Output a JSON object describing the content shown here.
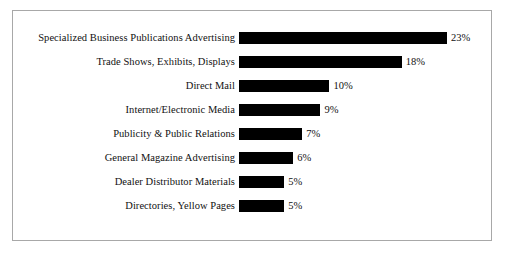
{
  "chart_data": {
    "type": "bar",
    "orientation": "horizontal",
    "title": "",
    "subtitle": "",
    "xlabel": "",
    "ylabel": "",
    "grid": false,
    "legend": false,
    "xlim": [
      0,
      23
    ],
    "value_suffix": "%",
    "categories": [
      "Specialized Business Publications Advertising",
      "Trade Shows, Exhibits, Displays",
      "Direct Mail",
      "Internet/Electronic Media",
      "Publicity & Public Relations",
      "General Magazine Advertising",
      "Dealer Distributor Materials",
      "Directories, Yellow Pages"
    ],
    "values": [
      23,
      18,
      10,
      9,
      7,
      6,
      5,
      5
    ],
    "labels": [
      "23%",
      "18%",
      "10%",
      "9%",
      "7%",
      "6%",
      "5%",
      "5%"
    ],
    "bar_color": "#000000",
    "background_color": "#ffffff",
    "border_color": "#a8a8a8"
  }
}
